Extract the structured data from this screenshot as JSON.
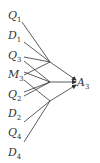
{
  "diagram": {
    "target": {
      "base": "A",
      "sub": "3",
      "x": 77,
      "y": 77
    },
    "sources": [
      {
        "id": "q1",
        "base": "Q",
        "sub": "1",
        "x": 8,
        "y": 10
      },
      {
        "id": "d1",
        "base": "D",
        "sub": "1",
        "x": 8,
        "y": 30
      },
      {
        "id": "q3",
        "base": "Q",
        "sub": "3",
        "x": 8,
        "y": 50
      },
      {
        "id": "m3",
        "base": "M",
        "sub": "3",
        "x": 8,
        "y": 69
      },
      {
        "id": "q2",
        "base": "Q",
        "sub": "2",
        "x": 8,
        "y": 89
      },
      {
        "id": "d2",
        "base": "D",
        "sub": "2",
        "x": 8,
        "y": 108
      },
      {
        "id": "q4",
        "base": "Q",
        "sub": "4",
        "x": 8,
        "y": 127
      },
      {
        "id": "d4",
        "base": "D",
        "sub": "4",
        "x": 8,
        "y": 147
      }
    ],
    "line_color": "#333333"
  }
}
